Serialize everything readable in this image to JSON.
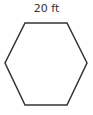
{
  "diagram": {
    "shape": "hexagon",
    "side_label": "20 ft",
    "stroke_color": "#333333",
    "fill_color": "#ffffff"
  }
}
